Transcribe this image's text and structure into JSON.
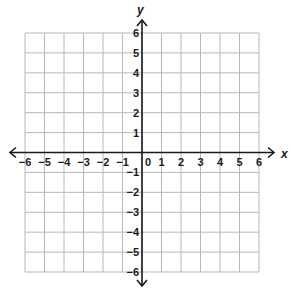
{
  "chart_data": {
    "type": "scatter",
    "title": "",
    "xlabel": "x",
    "ylabel": "y",
    "xlim": [
      -6,
      6
    ],
    "ylim": [
      -6,
      6
    ],
    "grid": true,
    "x_ticks": [
      -6,
      -5,
      -4,
      -3,
      -2,
      -1,
      0,
      1,
      2,
      3,
      4,
      5,
      6
    ],
    "y_ticks": [
      -6,
      -5,
      -4,
      -3,
      -2,
      -1,
      1,
      2,
      3,
      4,
      5,
      6
    ],
    "x_tick_labels": [
      "−6",
      "−5",
      "−4",
      "−3",
      "−2",
      "−1",
      "0",
      "1",
      "2",
      "3",
      "4",
      "5",
      "6"
    ],
    "y_tick_labels": [
      "−6",
      "−5",
      "−4",
      "−3",
      "−2",
      "−1",
      "1",
      "2",
      "3",
      "4",
      "5",
      "6"
    ],
    "series": []
  },
  "colors": {
    "grid": "#b8b8b8",
    "axis": "#1a1a1a",
    "background": "#ffffff"
  }
}
